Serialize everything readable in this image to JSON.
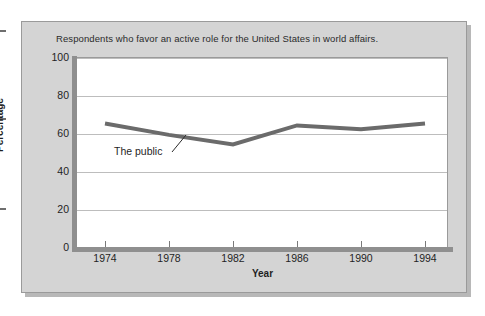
{
  "figure": {
    "title": "Respondents who favor an active role for the United States in world affairs.",
    "panel_color": "#d4d4d4",
    "plot_background": "#ffffff",
    "series_color": "#6b6b6b",
    "gridline_color": "#bdbdbd",
    "axis_color": "#8f8f8f"
  },
  "annotations": [
    {
      "label": "The public"
    }
  ],
  "chart_data": {
    "type": "line",
    "title": "Respondents who favor an active role for the United States in world affairs.",
    "xlabel": "Year",
    "ylabel": "Percentage",
    "x": [
      1974,
      1978,
      1982,
      1986,
      1990,
      1994
    ],
    "xtick_labels": [
      "1974",
      "1978",
      "1982",
      "1986",
      "1990",
      "1994"
    ],
    "ytick_labels": [
      "0",
      "20",
      "40",
      "60",
      "80",
      "100"
    ],
    "yticks": [
      0,
      20,
      40,
      60,
      80,
      100
    ],
    "xlim": [
      1974,
      1994
    ],
    "ylim": [
      0,
      100
    ],
    "grid": true,
    "legend": "none",
    "series": [
      {
        "name": "The public",
        "values": [
          65,
          59,
          54,
          64,
          62,
          65
        ]
      }
    ]
  }
}
